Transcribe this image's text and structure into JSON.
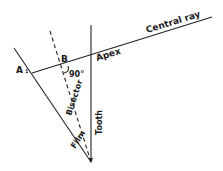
{
  "diagram": {
    "type": "bisecting-angle technique geometry",
    "labels": {
      "central_ray": "Central ray",
      "apex": "Apex",
      "point_a": "A",
      "point_a_sub": "1",
      "point_b": "B",
      "angle": "90°",
      "bisector": "Bisector",
      "tooth": "Tooth",
      "film": "Film"
    },
    "colors": {
      "line": "#222222",
      "text": "#1a1a1a",
      "background": "#ffffff"
    }
  }
}
